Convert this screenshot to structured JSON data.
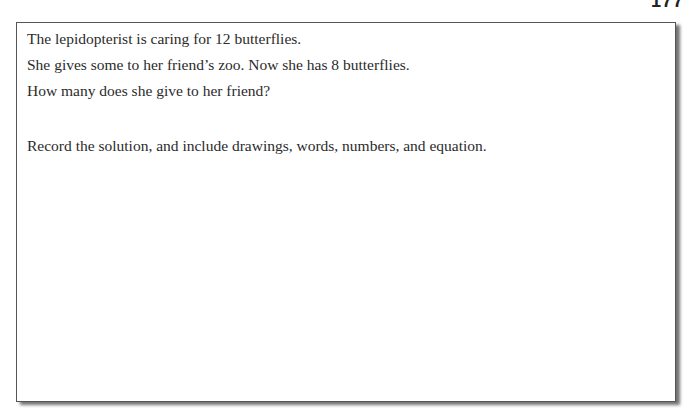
{
  "page": {
    "number": "177"
  },
  "problem": {
    "lines": [
      "The lepidopterist is caring for 12 butterflies.",
      "She gives some to her friend’s zoo. Now she has 8 butterflies.",
      "How many does she give to her friend?"
    ],
    "instruction": "Record the solution, and include drawings, words, numbers, and equation."
  }
}
